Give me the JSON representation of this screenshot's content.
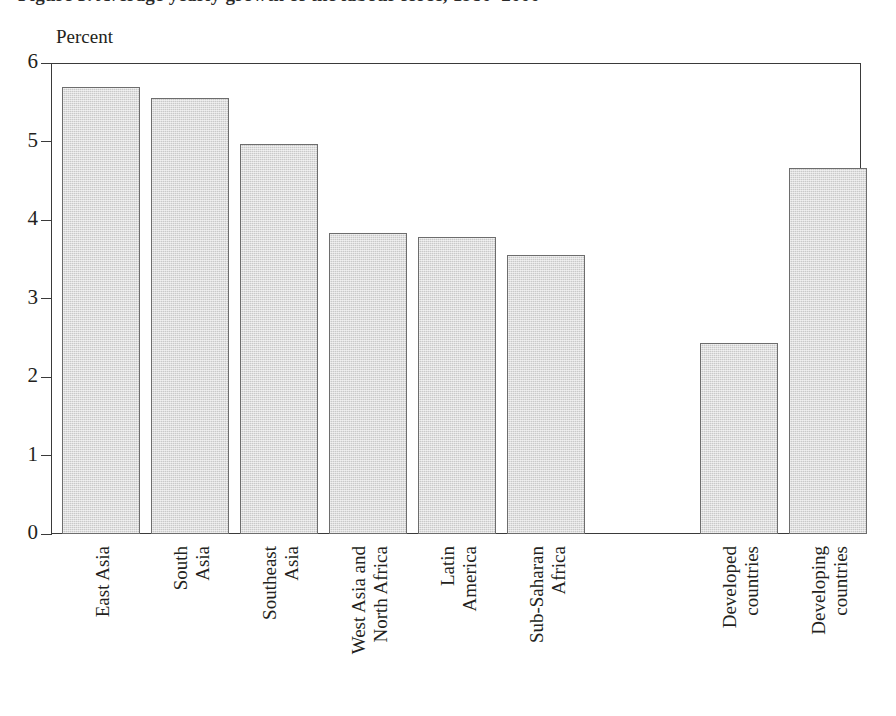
{
  "figure": {
    "caption_clipped": "Figure 5. Average yearly growth of the labour force, 1980–2000",
    "axis_title": "Percent"
  },
  "chart_data": {
    "type": "bar",
    "title": "",
    "xlabel": "",
    "ylabel": "Percent",
    "ylim": [
      0,
      6
    ],
    "yticks": [
      0,
      1,
      2,
      3,
      4,
      5,
      6
    ],
    "ytick_labels": [
      "0",
      "1",
      "2",
      "3",
      "4",
      "5",
      "6"
    ],
    "grid": false,
    "legend": "none",
    "categories": [
      "East Asia",
      "South Asia",
      "Southeast Asia",
      "West Asia and North Africa",
      "Latin America",
      "Sub-Saharan Africa",
      "Developed countries",
      "Developing countries"
    ],
    "category_lines": [
      [
        "East Asia"
      ],
      [
        "South",
        "Asia"
      ],
      [
        "Southeast",
        "Asia"
      ],
      [
        "West Asia and",
        "North Africa"
      ],
      [
        "Latin",
        "America"
      ],
      [
        "Sub-Saharan",
        "Africa"
      ],
      [
        "Developed",
        "countries"
      ],
      [
        "Developing",
        "countries"
      ]
    ],
    "values": [
      5.7,
      5.55,
      4.97,
      3.84,
      3.78,
      3.55,
      2.43,
      4.66
    ],
    "bar_color": "#c9c9c9",
    "bar_edge_color": "#6d6d6d",
    "group_gap_after_index": 5
  },
  "colors": {
    "background": "#ffffff",
    "axis": "#3a3a3a",
    "text": "#231f20",
    "bar_fill": "#c9c9c9",
    "bar_edge": "#6d6d6d"
  }
}
